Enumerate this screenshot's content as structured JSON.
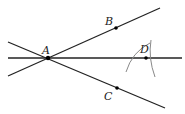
{
  "diagram": {
    "points": [
      {
        "name": "A",
        "x": 48,
        "y": 58,
        "label_x": 42,
        "label_y": 54
      },
      {
        "name": "B",
        "x": 116,
        "y": 28,
        "label_x": 105,
        "label_y": 25
      },
      {
        "name": "C",
        "x": 117,
        "y": 88,
        "label_x": 104,
        "label_y": 100
      },
      {
        "name": "D",
        "x": 146,
        "y": 58,
        "label_x": 140,
        "label_y": 53
      }
    ],
    "lines": [
      {
        "name": "ray-AB",
        "x1": 8,
        "y1": 76,
        "x2": 160,
        "y2": 8
      },
      {
        "name": "ray-AC",
        "x1": 8,
        "y1": 42,
        "x2": 165,
        "y2": 108
      },
      {
        "name": "line-AD",
        "x1": 8,
        "y1": 58,
        "x2": 182,
        "y2": 58
      }
    ],
    "arcs": [
      {
        "name": "arc-from-B",
        "d": "M 126 72 Q 132 52 150 43"
      },
      {
        "name": "arc-from-C",
        "d": "M 151 40 Q 148 58 155 77"
      }
    ],
    "colors": {
      "line": "#222222",
      "arc": "#888888",
      "point": "#000000"
    }
  }
}
